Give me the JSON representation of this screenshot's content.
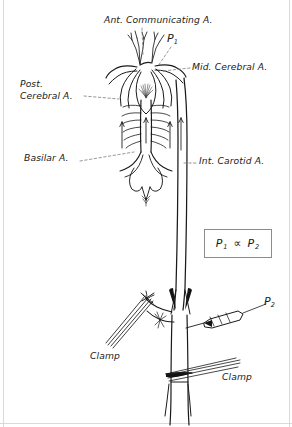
{
  "figure": {
    "title_alt": "Circle of Willis perfusion diagram",
    "background_color": "#ffffff",
    "ink_color": "#1a1a1a",
    "frame_color": "#d9d9d9"
  },
  "labels": {
    "ant_communicating": "Ant. Communicating A.",
    "p1": "P",
    "p1_sub": "1",
    "mid_cerebral": "Mid. Cerebral A.",
    "post_cerebral_line1": "Post.",
    "post_cerebral_line2": "Cerebral A.",
    "basilar": "Basilar A.",
    "int_carotid": "Int. Carotid A.",
    "p2": "P",
    "p2_sub": "2",
    "clamp_left": "Clamp",
    "clamp_right": "Clamp"
  },
  "equation": {
    "left": "P",
    "left_sub": "1",
    "operator": "∝",
    "right": "P",
    "right_sub": "2"
  },
  "anatomy_parts": [
    "anterior-communicating-artery",
    "anterior-cerebral-arteries",
    "middle-cerebral-artery",
    "posterior-cerebral-artery",
    "posterior-communicating-artery",
    "basilar-artery",
    "pontine-branches",
    "vertebral-arteries",
    "internal-carotid-artery",
    "common-carotid-artery",
    "external-carotid-artery",
    "cannula",
    "clamp-upper",
    "clamp-lower"
  ]
}
